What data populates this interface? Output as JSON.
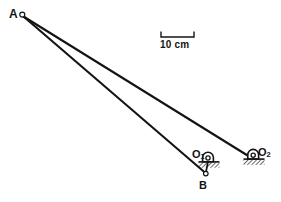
{
  "figure": {
    "type": "mechanism-linkage-diagram",
    "background": "#ffffff",
    "stroke_color": "#141414",
    "hatch_color": "#1a1a1a",
    "labels": {
      "joint_a": "A",
      "joint_b": "B",
      "support_o1_base": "O",
      "support_o1_sub": "1",
      "support_o2_base": "O",
      "support_o2_sub": "2"
    },
    "scale_bar": {
      "text": "10 cm",
      "length_px": 33
    },
    "points": {
      "A": {
        "x": 22,
        "y": 15
      },
      "B": {
        "x": 206,
        "y": 174
      },
      "O1": {
        "x": 208,
        "y": 161
      },
      "O2": {
        "x": 253,
        "y": 158
      }
    },
    "links": [
      {
        "name": "link-a-o2",
        "from": "A",
        "to": "O2"
      },
      {
        "name": "link-a-b",
        "from": "A",
        "to": "B"
      },
      {
        "name": "link-b-o1",
        "from": "B",
        "to": "O1"
      }
    ]
  }
}
